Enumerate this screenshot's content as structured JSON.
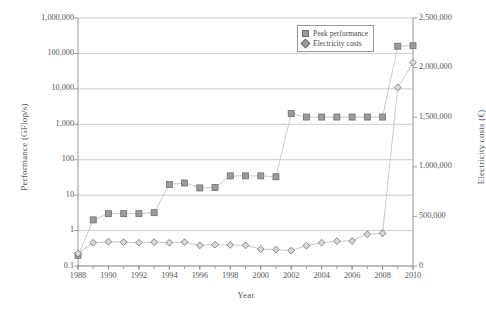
{
  "chart_data": {
    "type": "line",
    "title": "",
    "xlabel": "Year",
    "ylabel": "Performance (GFlop/s)",
    "y2label": "Electricity costs (€)",
    "x": [
      1988,
      1989,
      1990,
      1991,
      1992,
      1993,
      1994,
      1995,
      1996,
      1997,
      1998,
      1999,
      2000,
      2001,
      2002,
      2003,
      2004,
      2005,
      2006,
      2007,
      2008,
      2009,
      2010
    ],
    "xlim": [
      1988,
      2010
    ],
    "xticks": [
      "1988",
      "1990",
      "1992",
      "1994",
      "1996",
      "1998",
      "2000",
      "2002",
      "2004",
      "2006",
      "2008",
      "2010"
    ],
    "ylim": [
      0.1,
      1000000
    ],
    "yscale": "log",
    "yticks": [
      "0.1",
      "1",
      "10",
      "100",
      "1,000",
      "10,000",
      "100,000",
      "1,000,000"
    ],
    "y2lim": [
      0,
      2500000
    ],
    "y2scale": "linear",
    "y2ticks": [
      "0",
      "500,000",
      "1,000,000",
      "1,500,000",
      "2,000,000",
      "2,500,000"
    ],
    "grid": true,
    "legend_position": "top-right",
    "series": [
      {
        "name": "Peak performance",
        "axis": "left",
        "marker": "square",
        "color": "#9b9b9b",
        "x": [
          1988,
          1989,
          1990,
          1991,
          1992,
          1993,
          1994,
          1995,
          1996,
          1997,
          1998,
          1999,
          2000,
          2001,
          2002,
          2003,
          2004,
          2005,
          2006,
          2007,
          2008,
          2009,
          2010
        ],
        "values": [
          0.2,
          2,
          3,
          3,
          3,
          3.2,
          20,
          22,
          16,
          16.5,
          35,
          35,
          35,
          33,
          2000,
          1600,
          1600,
          1600,
          1600,
          1600,
          1600,
          160000,
          165000
        ]
      },
      {
        "name": "Electricity costs",
        "axis": "right",
        "marker": "diamond",
        "color": "#9b9b9b",
        "x": [
          1988,
          1989,
          1990,
          1991,
          1992,
          1993,
          1994,
          1995,
          1996,
          1997,
          1998,
          1999,
          2000,
          2001,
          2002,
          2003,
          2004,
          2005,
          2006,
          2007,
          2008,
          2009,
          2010
        ],
        "values": [
          125000,
          235000,
          245000,
          240000,
          235000,
          240000,
          235000,
          240000,
          208000,
          215000,
          212000,
          208000,
          170000,
          165000,
          155000,
          205000,
          235000,
          250000,
          252000,
          320000,
          330000,
          1800000,
          2050000
        ]
      }
    ]
  },
  "legend": {
    "items": [
      {
        "label": "Peak performance",
        "marker": "square-marker-icon"
      },
      {
        "label": "Electricity costs",
        "marker": "diamond-marker-icon"
      }
    ]
  },
  "axes": {
    "x_title": "Year",
    "y_left_title": "Performance (GFlop/s)",
    "y_right_title": "Electricity costs (€)"
  },
  "colors": {
    "series": "#9b9b9b",
    "marker_edge": "#6e6e6e",
    "grid": "#b5b5b5",
    "axis": "#8a8a8a",
    "text": "#4a4a4a"
  }
}
